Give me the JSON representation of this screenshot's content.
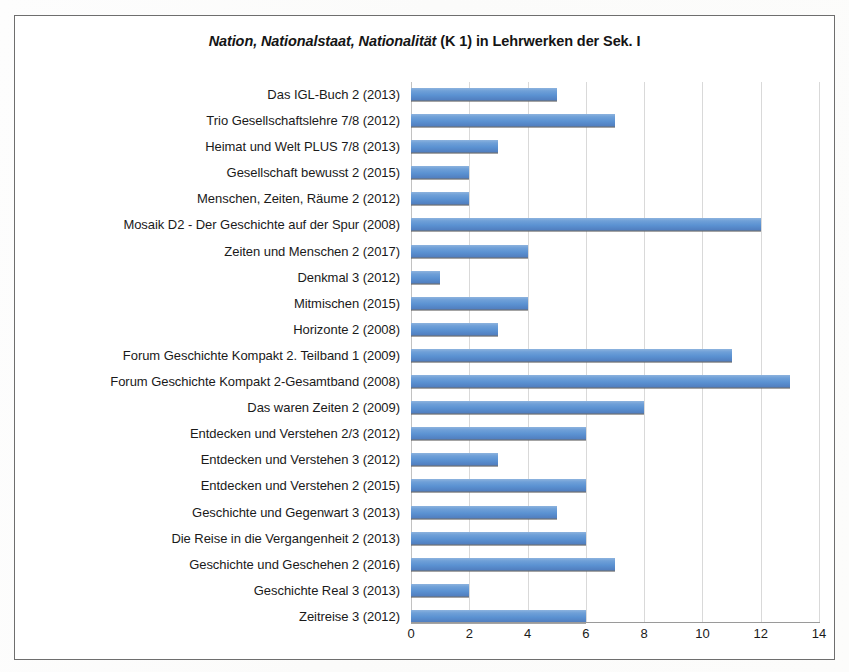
{
  "chart_data": {
    "type": "bar",
    "orientation": "horizontal",
    "title": "Nation, Nationalstaat, Nationalität (K 1) in Lehrwerken der Sek. I",
    "title_italic_part": "Nation, Nationalstaat, Nationalität",
    "title_plain_part": " (K 1) in Lehrwerken der Sek. I",
    "xlabel": "",
    "ylabel": "",
    "xlim": [
      0,
      14
    ],
    "xticks": [
      0,
      2,
      4,
      6,
      8,
      10,
      12,
      14
    ],
    "grid": "vertical",
    "legend": "none",
    "series_color": "#5B92D2",
    "categories": [
      "Das IGL-Buch 2 (2013)",
      "Trio Gesellschaftslehre 7/8 (2012)",
      "Heimat und Welt PLUS 7/8 (2013)",
      "Gesellschaft bewusst 2 (2015)",
      "Menschen, Zeiten, Räume 2 (2012)",
      "Mosaik D2 - Der Geschichte auf der Spur (2008)",
      "Zeiten und Menschen 2 (2017)",
      "Denkmal 3 (2012)",
      "Mitmischen (2015)",
      "Horizonte 2 (2008)",
      "Forum Geschichte Kompakt 2. Teilband 1 (2009)",
      "Forum Geschichte Kompakt 2-Gesamtband (2008)",
      "Das waren Zeiten 2 (2009)",
      "Entdecken und Verstehen 2/3 (2012)",
      "Entdecken und Verstehen 3 (2012)",
      "Entdecken und Verstehen 2 (2015)",
      "Geschichte und Gegenwart 3 (2013)",
      "Die Reise in die Vergangenheit 2 (2013)",
      "Geschichte und Geschehen 2 (2016)",
      "Geschichte Real 3 (2013)",
      "Zeitreise 3 (2012)"
    ],
    "values": [
      5,
      7,
      3,
      2,
      2,
      12,
      4,
      1,
      4,
      3,
      11,
      13,
      8,
      6,
      3,
      6,
      5,
      6,
      7,
      2,
      6
    ]
  },
  "page": {
    "footer_fragment": ""
  }
}
